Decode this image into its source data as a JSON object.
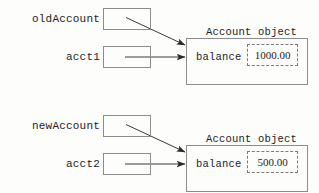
{
  "diagram": {
    "background_color": "#fdfdfc",
    "line_color": "#8c8c8c",
    "text_color": "#1c1c1c"
  },
  "groups": [
    {
      "id": "top",
      "variables": [
        {
          "name": "oldAccount",
          "label": "oldAccount",
          "value": "",
          "arrow": "diagonal"
        },
        {
          "name": "acct1",
          "label": "acct1",
          "value": "",
          "arrow": "horizontal"
        }
      ],
      "object": {
        "title": "Account object",
        "field_label": "balance",
        "field_value": "1000.00"
      }
    },
    {
      "id": "bottom",
      "variables": [
        {
          "name": "newAccount",
          "label": "newAccount",
          "value": "",
          "arrow": "diagonal"
        },
        {
          "name": "acct2",
          "label": "acct2",
          "value": "",
          "arrow": "horizontal"
        }
      ],
      "object": {
        "title": "Account object",
        "field_label": "balance",
        "field_value": "500.00"
      }
    }
  ]
}
